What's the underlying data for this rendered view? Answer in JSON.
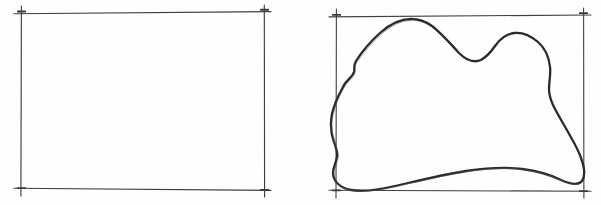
{
  "figure": {
    "background_color": "#fefefe",
    "ink_color": "#3f3f3f",
    "blob_ink_color": "#2b2b2b",
    "width": 601,
    "height": 205,
    "media": "pencil-on-paper scan",
    "panels": [
      {
        "id": "left-panel",
        "name": "empty-frame",
        "description": "Empty hand-drawn rectangle with cross tick marks at each corner",
        "frame": {
          "x1": 21,
          "y1": 13,
          "x2": 264,
          "y2": 189,
          "stroke_width": 1.1,
          "corner_ticks": true,
          "tick_overhang": 7
        },
        "contents": "none"
      },
      {
        "id": "right-panel",
        "name": "blob-frame",
        "description": "Hand-drawn rectangle containing an irregular closed curve (blob) inscribed so it touches all four sides",
        "frame": {
          "x1": 336,
          "y1": 16,
          "x2": 584,
          "y2": 191,
          "stroke_width": 1.1,
          "corner_ticks": true,
          "tick_overhang": 7
        },
        "contents": "irregular-closed-curve",
        "blob": {
          "name": "irregular-region",
          "stroke_width": 2.3,
          "closed": true,
          "filled": false,
          "touch_points": {
            "top": 410,
            "bottom": 366,
            "left": 341,
            "right": 583
          },
          "path": "M 411 19 C 396 20 382 29 371 40 C 362 49 356 57 353 62 C 352 66 355 68 354 72 C 352 77 347 80 344 86 C 339 95 335 104 333 113 C 331 123 332 133 335 141 C 337 147 339 151 338 156 C 337 162 334 166 334 172 C 334 180 340 187 350 190 C 362 192 377 190 394 186 C 416 181 441 175 466 171 C 487 168 506 167 522 169 C 538 171 551 175 561 180 C 570 184 577 186 581 182 C 585 177 584 168 581 160 C 578 151 573 142 568 133 C 563 124 558 116 554 108 C 551 102 549 96 549 90 C 549 82 551 74 550 67 C 549 58 545 49 538 43 C 531 37 522 33 514 33 C 506 33 500 38 495 45 C 491 51 487 57 481 60 C 474 63 466 60 459 53 C 450 44 441 34 432 27 C 425 22 418 19 411 19 Z"
        }
      }
    ]
  },
  "captions": []
}
